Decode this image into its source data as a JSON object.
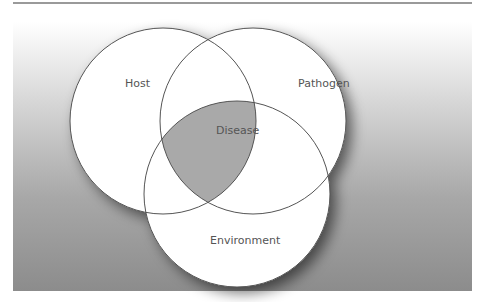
{
  "diagram": {
    "type": "venn",
    "sets": [
      {
        "id": "host",
        "label": "Host"
      },
      {
        "id": "pathogen",
        "label": "Pathogen"
      },
      {
        "id": "environment",
        "label": "Environment"
      }
    ],
    "intersection": {
      "label": "Disease",
      "of": [
        "host",
        "pathogen",
        "environment"
      ]
    }
  },
  "colors": {
    "circle_fill": "#ffffff",
    "circle_stroke": "#555555",
    "intersection_fill": "#a9a9a9",
    "background_top": "#ffffff",
    "background_bottom": "#8c8c8c"
  }
}
